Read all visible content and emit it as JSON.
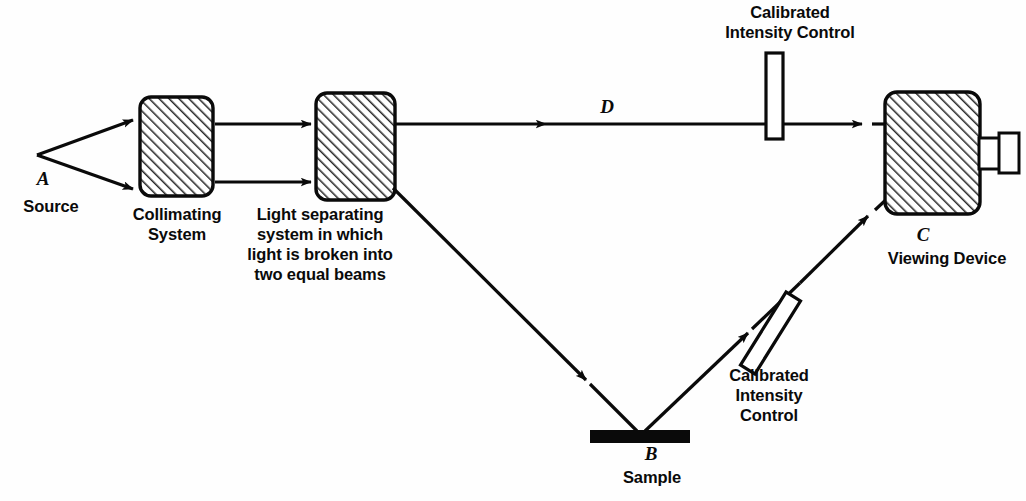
{
  "figure": {
    "type": "optical-schematic",
    "background_color": "#fefefe",
    "ink_color": "#0a0a0a",
    "hatch_color": "#2a2a2a"
  },
  "labels": {
    "source_letter": "A",
    "source": "Source",
    "collimating": "Collimating\nSystem",
    "separating": "Light separating\nsystem in which\nlight is broken into\ntwo equal beams",
    "control_top": "Calibrated\nIntensity Control",
    "reference_beam_letter": "D",
    "viewing_letter": "C",
    "viewing": "Viewing Device",
    "control_lower": "Calibrated\nIntensity\nControl",
    "sample_letter": "B",
    "sample": "Sample"
  },
  "components": [
    {
      "name": "source-point",
      "kind": "point",
      "x": 37,
      "y": 155
    },
    {
      "name": "collimating-system",
      "kind": "hatched-box",
      "x": 140,
      "y": 97,
      "width": 73,
      "height": 99
    },
    {
      "name": "light-separating-system",
      "kind": "hatched-box",
      "x": 316,
      "y": 93,
      "width": 79,
      "height": 107
    },
    {
      "name": "calibrated-intensity-control-top",
      "kind": "open-rect",
      "x": 766,
      "y": 53,
      "width": 17,
      "height": 86,
      "rotation": 0
    },
    {
      "name": "viewing-device",
      "kind": "hatched-box",
      "x": 885,
      "y": 92,
      "width": 95,
      "height": 122
    },
    {
      "name": "eyepiece",
      "kind": "open-rects",
      "x": 980,
      "y": 134,
      "width": 40,
      "height": 38
    },
    {
      "name": "calibrated-intensity-control-lower",
      "kind": "open-rect",
      "x": 762,
      "y": 290,
      "width": 17,
      "height": 86,
      "rotation": 32
    },
    {
      "name": "sample-bar",
      "kind": "solid-bar",
      "x": 590,
      "y": 430,
      "width": 100,
      "height": 13
    }
  ],
  "beams": [
    {
      "name": "source-upper-ray",
      "from": [
        37,
        155
      ],
      "to": [
        139,
        118
      ],
      "arrow": "end"
    },
    {
      "name": "source-lower-ray",
      "from": [
        37,
        155
      ],
      "to": [
        139,
        190
      ],
      "arrow": "end"
    },
    {
      "name": "collimated-upper",
      "from": [
        215,
        124
      ],
      "to": [
        316,
        124
      ],
      "arrow": "end"
    },
    {
      "name": "collimated-lower",
      "from": [
        215,
        182
      ],
      "to": [
        316,
        182
      ],
      "arrow": "end"
    },
    {
      "name": "reference-beam-d",
      "from": [
        397,
        124
      ],
      "to": [
        885,
        124
      ],
      "arrow": "mid",
      "passes": "calibrated-intensity-control-top"
    },
    {
      "name": "sample-incident",
      "from": [
        393,
        188
      ],
      "to": [
        636,
        430
      ],
      "arrow": "mid"
    },
    {
      "name": "sample-reflected",
      "from": [
        646,
        430
      ],
      "to": [
        885,
        198
      ],
      "arrow": "mid",
      "passes": "calibrated-intensity-control-lower"
    }
  ]
}
